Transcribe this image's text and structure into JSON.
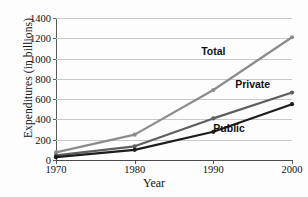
{
  "chart_data": {
    "type": "line",
    "title": "",
    "xlabel": "Year",
    "ylabel": "Expenditures (in billions)",
    "x": [
      1970,
      1980,
      1990,
      2000
    ],
    "xtick_labels": [
      "1970",
      "1980",
      "1990",
      "2000"
    ],
    "ytick_labels": [
      "0",
      "200",
      "400",
      "600",
      "800",
      "1000",
      "1200",
      "1400"
    ],
    "yticks": [
      0,
      200,
      400,
      600,
      800,
      1000,
      1200,
      1400
    ],
    "xlim": [
      1970,
      2000
    ],
    "ylim": [
      0,
      1400
    ],
    "grid": true,
    "legend": "inline-labels",
    "series": [
      {
        "name": "Total",
        "color": "#8c8c8c",
        "values": [
          75,
          250,
          690,
          1210
        ],
        "label_x": 1990,
        "label_y": 1075
      },
      {
        "name": "Private",
        "color": "#5e5e5e",
        "values": [
          45,
          135,
          410,
          665
        ],
        "label_x": 1995,
        "label_y": 745
      },
      {
        "name": "Public",
        "color": "#1c1c1c",
        "values": [
          28,
          100,
          278,
          550
        ],
        "label_x": 1992,
        "label_y": 320
      }
    ]
  }
}
